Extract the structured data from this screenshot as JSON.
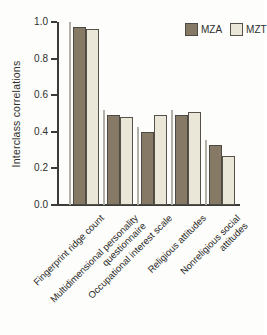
{
  "figure": {
    "background": "#fdfdfb",
    "axis_color": "#3b3b38",
    "text_color": "#2e2e2c",
    "artifact_line_color": "#b2b0a7"
  },
  "chart_data": {
    "type": "bar",
    "title": "",
    "xlabel": "",
    "ylabel": "Interclass correlations",
    "ylim": [
      0.0,
      1.0
    ],
    "yticks": [
      0.0,
      0.2,
      0.4,
      0.6,
      0.8,
      1.0
    ],
    "grid": false,
    "legend_position": "top-right",
    "categories": [
      "Fingerprint ridge count",
      "Multidimensional personality questionnaire",
      "Occupational interest scale",
      "Religious attitudes",
      "Nonreligious social attitudes"
    ],
    "category_label_lines": [
      [
        "Fingerprint ridge count"
      ],
      [
        "Multidimensional personality",
        "questionnaire"
      ],
      [
        "Occupational interest scale"
      ],
      [
        "Religious attitudes"
      ],
      [
        "Nonreligious social",
        "attitudes"
      ]
    ],
    "series": [
      {
        "name": "MZA",
        "color": "#867a67",
        "border": "#4d4a43",
        "values": [
          0.97,
          0.49,
          0.4,
          0.49,
          0.33
        ]
      },
      {
        "name": "MZT",
        "color": "#eae7d9",
        "border": "#56524a",
        "values": [
          0.96,
          0.48,
          0.49,
          0.51,
          0.27
        ]
      }
    ]
  }
}
